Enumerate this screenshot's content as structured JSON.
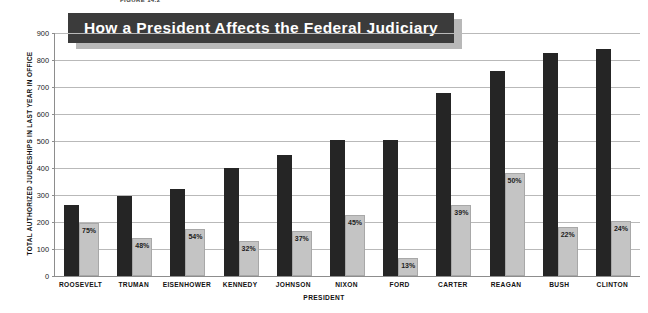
{
  "figure": {
    "label": "FIGURE 14.2",
    "title": "How a President Affects the Federal Judiciary",
    "xlabel": "PRESIDENT",
    "ylabel": "TOTAL AUTHORIZED JUDGESHIPS IN LAST YEAR IN OFFICE"
  },
  "colors": {
    "banner_bg": "#3b3b3b",
    "banner_shadow": "#b8b8b8",
    "banner_text": "#ffffff",
    "bar_dark": "#252525",
    "bar_light": "#c4c4c4",
    "gridline": "#b9b9b9",
    "axis": "#8d8d8d"
  },
  "chart_data": {
    "type": "bar",
    "title": "How a President Affects the Federal Judiciary",
    "xlabel": "PRESIDENT",
    "ylabel": "TOTAL AUTHORIZED JUDGESHIPS IN LAST YEAR IN OFFICE",
    "ylim": [
      0,
      900
    ],
    "yticks": [
      0,
      100,
      200,
      300,
      400,
      500,
      600,
      700,
      800,
      900
    ],
    "grid": true,
    "legend": "none",
    "categories": [
      "ROOSEVELT",
      "TRUMAN",
      "EISENHOWER",
      "KENNEDY",
      "JOHNSON",
      "NIXON",
      "FORD",
      "CARTER",
      "REAGAN",
      "BUSH",
      "CLINTON"
    ],
    "series": [
      {
        "name": "Total authorized judgeships in last year in office",
        "color": "#252525",
        "values": [
          262,
          296,
          322,
          401,
          449,
          504,
          504,
          677,
          761,
          825,
          841
        ]
      },
      {
        "name": "Judgeships filled by the president",
        "color": "#c4c4c4",
        "values": [
          197,
          142,
          174,
          128,
          166,
          227,
          66,
          264,
          381,
          182,
          202
        ]
      }
    ],
    "annotations": [
      {
        "category": "ROOSEVELT",
        "label": "75%"
      },
      {
        "category": "TRUMAN",
        "label": "48%"
      },
      {
        "category": "EISENHOWER",
        "label": "54%"
      },
      {
        "category": "KENNEDY",
        "label": "32%"
      },
      {
        "category": "JOHNSON",
        "label": "37%"
      },
      {
        "category": "NIXON",
        "label": "45%"
      },
      {
        "category": "FORD",
        "label": "13%"
      },
      {
        "category": "CARTER",
        "label": "39%"
      },
      {
        "category": "REAGAN",
        "label": "50%"
      },
      {
        "category": "BUSH",
        "label": "22%"
      },
      {
        "category": "CLINTON",
        "label": "24%"
      }
    ]
  }
}
